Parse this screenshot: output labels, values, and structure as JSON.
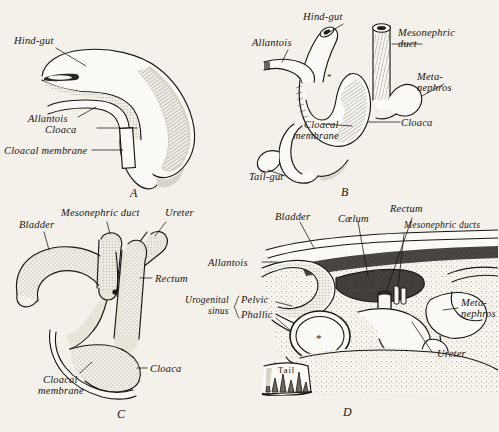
{
  "figure": {
    "background_color": "#f3f1ea",
    "ink_color": "#17140f",
    "panel_count": 4
  },
  "panels": [
    {
      "letter": "A",
      "name": "panel-a",
      "labels": [
        {
          "id": "hind-gut",
          "text": "Hind-gut"
        },
        {
          "id": "allantois",
          "text": "Allantois"
        },
        {
          "id": "cloaca",
          "text": "Cloaca"
        },
        {
          "id": "cloacal-membrane",
          "text": "Cloacal membrane"
        }
      ]
    },
    {
      "letter": "B",
      "name": "panel-b",
      "labels": [
        {
          "id": "hind-gut",
          "text": "Hind-gut"
        },
        {
          "id": "allantois",
          "text": "Allantois"
        },
        {
          "id": "mesonephric-duct-1",
          "text": "Mesonephric"
        },
        {
          "id": "mesonephric-duct-2",
          "text": "duct"
        },
        {
          "id": "metanephros-1",
          "text": "Meta-"
        },
        {
          "id": "metanephros-2",
          "text": "nephros"
        },
        {
          "id": "cloaca",
          "text": "Cloaca"
        },
        {
          "id": "cloacal-membrane-1",
          "text": "Cloacal"
        },
        {
          "id": "cloacal-membrane-2",
          "text": "membrane"
        },
        {
          "id": "tail-gut",
          "text": "Tail-gut"
        }
      ]
    },
    {
      "letter": "C",
      "name": "panel-c",
      "labels": [
        {
          "id": "mesonephric-duct",
          "text": "Mesonephric duct"
        },
        {
          "id": "ureter",
          "text": "Ureter"
        },
        {
          "id": "bladder",
          "text": "Bladder"
        },
        {
          "id": "rectum",
          "text": "Rectum"
        },
        {
          "id": "cloaca",
          "text": "Cloaca"
        },
        {
          "id": "cloacal-membrane-1",
          "text": "Cloacal"
        },
        {
          "id": "cloacal-membrane-2",
          "text": "membrane"
        }
      ]
    },
    {
      "letter": "D",
      "name": "panel-d",
      "labels": [
        {
          "id": "bladder",
          "text": "Bladder"
        },
        {
          "id": "coelum",
          "text": "Cœlum"
        },
        {
          "id": "rectum",
          "text": "Rectum"
        },
        {
          "id": "mesonephric-ducts",
          "text": "Mesonephric ducts"
        },
        {
          "id": "allantois",
          "text": "Allantois"
        },
        {
          "id": "urogenital-1",
          "text": "Urogenital"
        },
        {
          "id": "urogenital-2",
          "text": "sinus"
        },
        {
          "id": "pelvic",
          "text": "Pelvic"
        },
        {
          "id": "phallic",
          "text": "Phallic"
        },
        {
          "id": "metanephros-1",
          "text": "Meta-"
        },
        {
          "id": "metanephros-2",
          "text": "nephros"
        },
        {
          "id": "ureter",
          "text": "Ureter"
        },
        {
          "id": "tail",
          "text": "Tail"
        }
      ]
    }
  ]
}
